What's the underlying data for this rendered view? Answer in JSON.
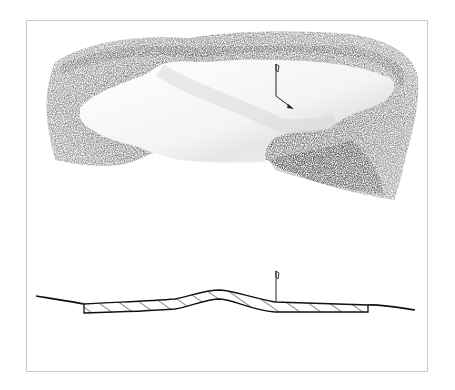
{
  "figure": {
    "plan_view": {
      "label": "green-plan-view",
      "flag": "pin-flag",
      "shading_color": "#5a5a5a",
      "green_color": "#ffffff"
    },
    "section_view": {
      "label": "green-cross-section",
      "hatch": "diagonal",
      "line_color": "#111111"
    },
    "frame_color": "#c9c9c9"
  }
}
